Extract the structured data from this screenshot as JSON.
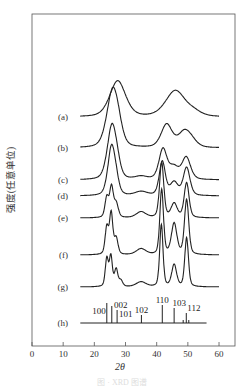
{
  "chart_data": {
    "type": "line",
    "title": "",
    "xlabel": "2θ",
    "ylabel": "强度(任意单位)",
    "xlim": [
      0,
      65
    ],
    "xticks": [
      0,
      10,
      20,
      30,
      40,
      50,
      60
    ],
    "grid": false,
    "legend": "inline labels (a)–(h) left of each curve",
    "series": [
      {
        "name": "(a)",
        "baseline_px": 117,
        "peaks": [
          [
            27.5,
            36,
            2.6
          ],
          [
            46,
            26,
            3.2
          ],
          [
            52,
            4,
            2.5
          ]
        ],
        "x_range": [
          15.5,
          60
        ]
      },
      {
        "name": "(b)",
        "baseline_px": 148,
        "peaks": [
          [
            25.8,
            54,
            1.9
          ],
          [
            27.5,
            12,
            1.5
          ],
          [
            43.2,
            23,
            1.8
          ],
          [
            48.8,
            14,
            2.0
          ],
          [
            51,
            6,
            2.0
          ]
        ],
        "x_range": [
          15.5,
          60
        ]
      },
      {
        "name": "(c)",
        "baseline_px": 180,
        "peaks": [
          [
            25.6,
            52,
            1.5
          ],
          [
            27.2,
            10,
            1.2
          ],
          [
            35,
            3,
            2.0
          ],
          [
            42,
            30,
            1.3
          ],
          [
            45.5,
            12,
            1.6
          ],
          [
            49.5,
            22,
            1.4
          ]
        ],
        "x_range": [
          15.5,
          60
        ]
      },
      {
        "name": "(d)",
        "baseline_px": 196,
        "peaks": [
          [
            25.5,
            48,
            1.2
          ],
          [
            27,
            10,
            1.0
          ],
          [
            35,
            4,
            2.0
          ],
          [
            41.8,
            34,
            1.0
          ],
          [
            45.6,
            13,
            1.3
          ],
          [
            49.6,
            28,
            1.1
          ]
        ],
        "x_range": [
          15.5,
          60
        ]
      },
      {
        "name": "(e)",
        "baseline_px": 218,
        "peaks": [
          [
            24,
            20,
            0.6
          ],
          [
            25.5,
            30,
            0.6
          ],
          [
            27,
            14,
            0.7
          ],
          [
            35,
            6,
            1.6
          ],
          [
            41.6,
            55,
            0.7
          ],
          [
            45.6,
            14,
            1.0
          ],
          [
            49.6,
            35,
            0.8
          ]
        ],
        "x_range": [
          15.5,
          60
        ]
      },
      {
        "name": "(f)",
        "baseline_px": 255,
        "peaks": [
          [
            24,
            27,
            0.55
          ],
          [
            25.4,
            41,
            0.55
          ],
          [
            27,
            16,
            0.6
          ],
          [
            35,
            6,
            1.6
          ],
          [
            41.6,
            65,
            0.6
          ],
          [
            45.6,
            31,
            0.9
          ],
          [
            49.6,
            55,
            0.7
          ]
        ],
        "x_range": [
          15.5,
          60
        ]
      },
      {
        "name": "(g)",
        "baseline_px": 287,
        "peaks": [
          [
            24,
            28,
            0.5
          ],
          [
            25.3,
            30,
            0.5
          ],
          [
            27,
            17,
            0.55
          ],
          [
            28.5,
            6,
            0.6
          ],
          [
            35,
            5,
            1.6
          ],
          [
            41.5,
            62,
            0.55
          ],
          [
            45.6,
            22,
            0.8
          ],
          [
            49.6,
            49,
            0.6
          ]
        ],
        "x_range": [
          15.5,
          60
        ]
      },
      {
        "name": "(h)",
        "type": "stick",
        "baseline_px": 323,
        "x_range": [
          15.5,
          56
        ],
        "sticks": [
          {
            "x": 24.0,
            "h": 20,
            "label": "100"
          },
          {
            "x": 25.6,
            "h": 17,
            "label": "002"
          },
          {
            "x": 27.3,
            "h": 13,
            "label": "101"
          },
          {
            "x": 35.1,
            "h": 8,
            "label": "102"
          },
          {
            "x": 41.8,
            "h": 18,
            "label": "110"
          },
          {
            "x": 45.6,
            "h": 15,
            "label": "103"
          },
          {
            "x": 48.5,
            "h": 3,
            "label": ""
          },
          {
            "x": 49.5,
            "h": 10,
            "label": "112"
          },
          {
            "x": 50.3,
            "h": 3,
            "label": ""
          }
        ]
      }
    ]
  },
  "axis": {
    "x_title": "2θ",
    "y_title": "强度(任意单位)",
    "tick_labels": [
      "0",
      "10",
      "20",
      "30",
      "40",
      "50",
      "60"
    ]
  },
  "caption": "图 · XRD 图谱"
}
